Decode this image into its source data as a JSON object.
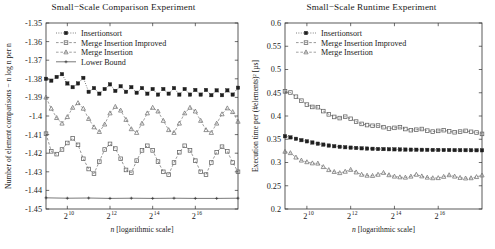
{
  "figure": {
    "width": 495,
    "height": 249,
    "background": "#ffffff",
    "ink": "#1a1a1a"
  },
  "chart_data": [
    {
      "id": "comparison",
      "type": "line",
      "title": "Small−Scale Comparison Experiment",
      "xlabel": "n [logarithmic scale]",
      "ylabel": "Number of element comparisons − n log n per n",
      "xscale": "log2",
      "xlim": [
        512,
        262144
      ],
      "ylim": [
        -1.45,
        -1.35
      ],
      "grid": false,
      "legend_position": "top-left",
      "xticks": [
        {
          "value": 1024,
          "label": "2",
          "exp": "10"
        },
        {
          "value": 4096,
          "label": "2",
          "exp": "12"
        },
        {
          "value": 16384,
          "label": "2",
          "exp": "14"
        },
        {
          "value": 65536,
          "label": "2",
          "exp": "16"
        }
      ],
      "yticks": [
        "-1.35",
        "-1.36",
        "-1.37",
        "-1.38",
        "-1.39",
        "-1.4",
        "-1.41",
        "-1.42",
        "-1.43",
        "-1.44",
        "-1.45"
      ],
      "ytick_values": [
        -1.35,
        -1.36,
        -1.37,
        -1.38,
        -1.39,
        -1.4,
        -1.41,
        -1.42,
        -1.43,
        -1.44,
        -1.45
      ],
      "series": [
        {
          "name": "Insertionsort",
          "marker": "filled-square",
          "linestyle": "dotted",
          "color": "#202020",
          "x": [
            512,
            608,
            724,
            861,
            1024,
            1218,
            1448,
            1722,
            2048,
            2435,
            2896,
            3444,
            4096,
            4871,
            5793,
            6889,
            8192,
            9742,
            11585,
            13777,
            16384,
            19484,
            23170,
            27554,
            32768,
            38968,
            46341,
            55109,
            65536,
            77936,
            92682,
            110218,
            131072,
            155872,
            185364,
            220436,
            262144
          ],
          "values": [
            -1.38,
            -1.381,
            -1.379,
            -1.3775,
            -1.3825,
            -1.3845,
            -1.3825,
            -1.3795,
            -1.387,
            -1.385,
            -1.388,
            -1.3855,
            -1.383,
            -1.3865,
            -1.384,
            -1.387,
            -1.3845,
            -1.3875,
            -1.385,
            -1.388,
            -1.3855,
            -1.3885,
            -1.3855,
            -1.388,
            -1.385,
            -1.3885,
            -1.3855,
            -1.3885,
            -1.386,
            -1.3885,
            -1.386,
            -1.3888,
            -1.3862,
            -1.3888,
            -1.3862,
            -1.3885,
            -1.3848
          ]
        },
        {
          "name": "Merge Insertion Improved",
          "marker": "open-square",
          "linestyle": "dashed",
          "color": "#606060",
          "x": [
            512,
            608,
            724,
            861,
            1024,
            1218,
            1448,
            1722,
            2048,
            2435,
            2896,
            3444,
            4096,
            4871,
            5793,
            6889,
            8192,
            9742,
            11585,
            13777,
            16384,
            19484,
            23170,
            27554,
            32768,
            38968,
            46341,
            55109,
            65536,
            77936,
            92682,
            110218,
            131072,
            155872,
            185364,
            220436,
            262144
          ],
          "values": [
            -1.4095,
            -1.419,
            -1.4205,
            -1.418,
            -1.4145,
            -1.412,
            -1.4155,
            -1.423,
            -1.4285,
            -1.431,
            -1.4245,
            -1.418,
            -1.415,
            -1.4175,
            -1.423,
            -1.429,
            -1.4305,
            -1.424,
            -1.4185,
            -1.416,
            -1.4185,
            -1.4245,
            -1.43,
            -1.4315,
            -1.425,
            -1.4195,
            -1.416,
            -1.4185,
            -1.424,
            -1.43,
            -1.4315,
            -1.425,
            -1.4195,
            -1.4165,
            -1.419,
            -1.425,
            -1.43
          ]
        },
        {
          "name": "Merge Insertion",
          "marker": "open-triangle",
          "linestyle": "dashed",
          "color": "#707070",
          "x": [
            512,
            608,
            724,
            861,
            1024,
            1218,
            1448,
            1722,
            2048,
            2435,
            2896,
            3444,
            4096,
            4871,
            5793,
            6889,
            8192,
            9742,
            11585,
            13777,
            16384,
            19484,
            23170,
            27554,
            32768,
            38968,
            46341,
            55109,
            65536,
            77936,
            92682,
            110218,
            131072,
            155872,
            185364,
            220436,
            262144
          ],
          "values": [
            -1.39,
            -1.396,
            -1.401,
            -1.404,
            -1.4005,
            -1.3955,
            -1.393,
            -1.396,
            -1.4015,
            -1.406,
            -1.4085,
            -1.4045,
            -1.3985,
            -1.395,
            -1.397,
            -1.402,
            -1.407,
            -1.409,
            -1.404,
            -1.3985,
            -1.3955,
            -1.3975,
            -1.4025,
            -1.4075,
            -1.409,
            -1.404,
            -1.3985,
            -1.3955,
            -1.3975,
            -1.4025,
            -1.4075,
            -1.409,
            -1.404,
            -1.399,
            -1.3958,
            -1.3978,
            -1.403
          ]
        },
        {
          "name": "Lower Bound",
          "marker": "small-cross",
          "linestyle": "solid",
          "color": "#303030",
          "x": [
            512,
            1024,
            2048,
            4096,
            8192,
            16384,
            32768,
            65536,
            131072,
            262144
          ],
          "values": [
            -1.444,
            -1.4442,
            -1.4441,
            -1.4443,
            -1.4442,
            -1.4443,
            -1.4442,
            -1.4443,
            -1.4443,
            -1.4442
          ]
        }
      ]
    },
    {
      "id": "runtime",
      "type": "line",
      "title": "Small−Scale Runtime Experiment",
      "xlabel": "n [logarithmic scale]",
      "ylabel": "Execution time per (#elements)² [µs]",
      "xscale": "log2",
      "xlim": [
        512,
        262144
      ],
      "ylim": [
        0.2,
        0.6
      ],
      "grid": false,
      "legend_position": "top-left",
      "xticks": [
        {
          "value": 1024,
          "label": "2",
          "exp": "10"
        },
        {
          "value": 4096,
          "label": "2",
          "exp": "12"
        },
        {
          "value": 16384,
          "label": "2",
          "exp": "14"
        },
        {
          "value": 65536,
          "label": "2",
          "exp": "16"
        }
      ],
      "yticks": [
        "0.6",
        "0.55",
        "0.5",
        "0.45",
        "0.4",
        "0.35",
        "0.3",
        "0.25",
        "0.2"
      ],
      "ytick_values": [
        0.6,
        0.55,
        0.5,
        0.45,
        0.4,
        0.35,
        0.3,
        0.25,
        0.2
      ],
      "series": [
        {
          "name": "Insertionsort",
          "marker": "filled-square",
          "linestyle": "dotted",
          "color": "#202020",
          "x": [
            512,
            608,
            724,
            861,
            1024,
            1218,
            1448,
            1722,
            2048,
            2435,
            2896,
            3444,
            4096,
            4871,
            5793,
            6889,
            8192,
            9742,
            11585,
            13777,
            16384,
            19484,
            23170,
            27554,
            32768,
            38968,
            46341,
            55109,
            65536,
            77936,
            92682,
            110218,
            131072,
            155872,
            185364,
            220436,
            262144
          ],
          "values": [
            0.3565,
            0.354,
            0.351,
            0.348,
            0.3455,
            0.343,
            0.3405,
            0.3385,
            0.3365,
            0.335,
            0.3338,
            0.3328,
            0.332,
            0.3312,
            0.3305,
            0.33,
            0.3295,
            0.329,
            0.3288,
            0.3285,
            0.3283,
            0.328,
            0.3278,
            0.3276,
            0.3275,
            0.3273,
            0.3272,
            0.327,
            0.327,
            0.3268,
            0.3268,
            0.3266,
            0.3265,
            0.3265,
            0.3264,
            0.3263,
            0.3262
          ]
        },
        {
          "name": "Merge Insertion Improved",
          "marker": "open-square",
          "linestyle": "dashed",
          "color": "#606060",
          "x": [
            512,
            608,
            724,
            861,
            1024,
            1218,
            1448,
            1722,
            2048,
            2435,
            2896,
            3444,
            4096,
            4871,
            5793,
            6889,
            8192,
            9742,
            11585,
            13777,
            16384,
            19484,
            23170,
            27554,
            32768,
            38968,
            46341,
            55109,
            65536,
            77936,
            92682,
            110218,
            131072,
            155872,
            185364,
            220436,
            262144
          ],
          "values": [
            0.453,
            0.4505,
            0.4415,
            0.433,
            0.4245,
            0.4195,
            0.419,
            0.4105,
            0.4035,
            0.398,
            0.3955,
            0.3985,
            0.394,
            0.388,
            0.383,
            0.3805,
            0.379,
            0.3795,
            0.376,
            0.373,
            0.3745,
            0.376,
            0.372,
            0.3695,
            0.3705,
            0.372,
            0.3685,
            0.3665,
            0.368,
            0.3695,
            0.367,
            0.365,
            0.3665,
            0.368,
            0.366,
            0.3645,
            0.3615
          ]
        },
        {
          "name": "Merge Insertion",
          "marker": "open-triangle",
          "linestyle": "dashed",
          "color": "#707070",
          "x": [
            512,
            608,
            724,
            861,
            1024,
            1218,
            1448,
            1722,
            2048,
            2435,
            2896,
            3444,
            4096,
            4871,
            5793,
            6889,
            8192,
            9742,
            11585,
            13777,
            16384,
            19484,
            23170,
            27554,
            32768,
            38968,
            46341,
            55109,
            65536,
            77936,
            92682,
            110218,
            131072,
            155872,
            185364,
            220436,
            262144
          ],
          "values": [
            0.3235,
            0.3205,
            0.311,
            0.3045,
            0.301,
            0.2985,
            0.298,
            0.2905,
            0.284,
            0.28,
            0.2775,
            0.2805,
            0.2845,
            0.279,
            0.274,
            0.272,
            0.2715,
            0.274,
            0.278,
            0.273,
            0.27,
            0.2685,
            0.2678,
            0.27,
            0.274,
            0.2705,
            0.2678,
            0.2665,
            0.2668,
            0.2695,
            0.273,
            0.27,
            0.2672,
            0.266,
            0.2665,
            0.269,
            0.2725
          ]
        }
      ]
    }
  ]
}
